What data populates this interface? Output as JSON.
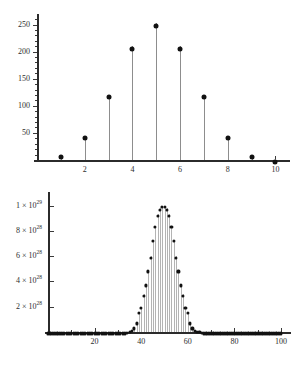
{
  "figure": {
    "background": "#ffffff",
    "point_color": "#111111",
    "axis_color": "#2b2b2b",
    "stem_color_top": "#8d8d8d",
    "stem_color_bottom": "#b4b4b4"
  },
  "chart_data": [
    {
      "id": "top",
      "type": "scatter",
      "title": "",
      "subtitle": "",
      "xlabel": "",
      "ylabel": "",
      "grid": false,
      "legend": null,
      "stems": true,
      "xlim": [
        0,
        10.4
      ],
      "ylim": [
        0,
        262
      ],
      "x": [
        1,
        2,
        3,
        4,
        5,
        6,
        7,
        8,
        9,
        10
      ],
      "values": [
        10,
        45,
        120,
        210,
        252,
        210,
        120,
        45,
        10,
        1
      ],
      "xticks": [
        2,
        4,
        6,
        8,
        10
      ],
      "xticklabels": [
        "2",
        "4",
        "6",
        "8",
        "10"
      ],
      "xminorticks": [
        1,
        3,
        5,
        7,
        9
      ],
      "yticks": [
        50,
        100,
        150,
        200,
        250
      ],
      "yticklabels": [
        "50",
        "100",
        "150",
        "200",
        "250"
      ],
      "yminortick_step": 10
    },
    {
      "id": "bottom",
      "type": "scatter",
      "title": "",
      "subtitle": "",
      "xlabel": "",
      "ylabel": "",
      "grid": false,
      "legend": null,
      "stems": true,
      "xlim": [
        0,
        103
      ],
      "ylim": [
        0,
        1.06e+29
      ],
      "x": [
        0,
        2,
        4,
        6,
        8,
        10,
        12,
        14,
        16,
        18,
        20,
        22,
        24,
        26,
        28,
        30,
        32,
        34,
        36,
        37,
        38,
        39,
        40,
        41,
        42,
        43,
        44,
        45,
        46,
        47,
        48,
        49,
        50,
        51,
        52,
        53,
        54,
        55,
        56,
        57,
        58,
        59,
        60,
        61,
        62,
        63,
        64,
        66,
        68,
        70,
        72,
        74,
        76,
        78,
        80,
        82,
        84,
        86,
        88,
        90,
        92,
        94,
        96,
        98,
        100
      ],
      "values": [
        0,
        0,
        0,
        0,
        0,
        0,
        0,
        0,
        0,
        0,
        0,
        0,
        0,
        0,
        0,
        0,
        0,
        0,
        4e+27,
        8e+27,
        1.6e+28,
        3e+28,
        5.2e+28,
        8.4e+28,
        1.2e+29,
        0,
        0,
        0,
        0,
        0,
        0,
        0,
        0,
        0,
        0,
        0,
        0,
        0,
        0,
        0,
        0,
        0,
        0,
        0,
        0,
        0,
        0,
        0,
        0,
        0,
        0,
        0,
        0,
        0,
        0,
        0,
        0,
        0,
        0,
        0,
        0,
        0,
        0,
        0,
        0
      ],
      "peak_profile": {
        "center": 50,
        "peak_value": 1e+29,
        "half_width": 5,
        "points_x": [
          36,
          37,
          38,
          39,
          40,
          41,
          42,
          43,
          44,
          45,
          46,
          47,
          48,
          49,
          50,
          51,
          52,
          53,
          54,
          55,
          56,
          57,
          58,
          59,
          60,
          61,
          62,
          63,
          64
        ],
        "points_y": [
          2e+27,
          4e+27,
          8e+27,
          1.6e+28,
          2e+28,
          3e+28,
          3.8e+28,
          4.9e+28,
          6e+28,
          7.3e+28,
          8.4e+28,
          9.3e+28,
          9.8e+28,
          1e+29,
          1e+29,
          9.8e+28,
          9.3e+28,
          8.4e+28,
          7.3e+28,
          6e+28,
          4.9e+28,
          3.8e+28,
          3e+28,
          2e+28,
          1.6e+28,
          8e+27,
          4e+27,
          2e+27,
          1e+27
        ]
      },
      "xticks": [
        20,
        40,
        60,
        80,
        100
      ],
      "xticklabels": [
        "20",
        "40",
        "60",
        "80",
        "100"
      ],
      "yticks": [
        2e+28,
        4e+28,
        6e+28,
        8e+28,
        1e+29
      ],
      "yticklabels": [
        "2 × 10",
        "4 × 10",
        "6 × 10",
        "8 × 10",
        "1 × 10"
      ],
      "yticklabel_exponents": [
        "28",
        "28",
        "28",
        "28",
        "29"
      ]
    }
  ]
}
